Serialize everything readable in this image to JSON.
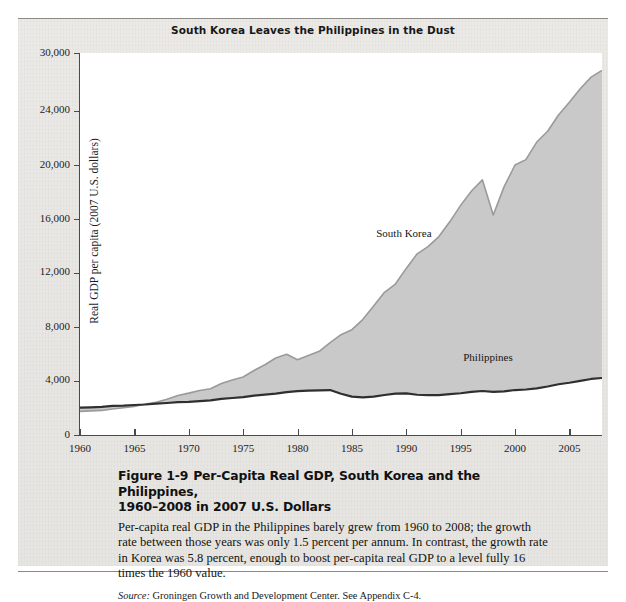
{
  "figure": {
    "chart_title": "South Korea Leaves the Philippines in the Dust",
    "caption_heading_line1": "Per-Capita Real GDP, South Korea and the Philippines,",
    "caption_heading_line2": "1960–2008 in 2007 U.S. Dollars",
    "figure_number": "Figure 1-9",
    "caption_body": "Per-capita real GDP in the Philippines barely grew from 1960 to 2008; the growth rate between those years was only 1.5 percent per annum. In contrast, the growth rate in Korea was 5.8 percent, enough to boost per-capita real GDP to a level fully 16 times the 1960 value.",
    "source_label": "Source:",
    "source_text": "Groningen Growth and Development Center. See Appendix C-4."
  },
  "colors": {
    "korea_fill": "#c9c9c9",
    "korea_line": "#9a9a9a",
    "philippines_line": "#2f2f2f",
    "axis": "#4a4a4a",
    "panel_bg": "#eae8e4",
    "plot_bg": "#ffffff"
  },
  "chart_data": {
    "type": "area",
    "title": "South Korea Leaves the Philippines in the Dust",
    "xlabel": "",
    "ylabel": "Real GDP per capita (2007 U.S. dollars)",
    "xlim": [
      1960,
      2008
    ],
    "ylim": [
      0,
      30000
    ],
    "grid": false,
    "legend_position": "inline-annotation",
    "xticks": [
      1960,
      1965,
      1970,
      1975,
      1980,
      1985,
      1990,
      1995,
      2000,
      2005
    ],
    "xtick_labels": [
      "1960",
      "1965",
      "1970",
      "1975",
      "1980",
      "1985",
      "1990",
      "1995",
      "2000",
      "2005"
    ],
    "yticks": [
      0,
      4000,
      8000,
      12000,
      16000,
      20000,
      24000,
      30000
    ],
    "ytick_labels": [
      "0",
      "4,000",
      "8,000",
      "12,000",
      "16,000",
      "20,000",
      "24,000",
      "30,000"
    ],
    "annotations": [
      {
        "text": "South Korea",
        "x": 1990,
        "y": 14800
      },
      {
        "text": "Philippines",
        "x": 1998,
        "y": 5600
      }
    ],
    "x": [
      1960,
      1961,
      1962,
      1963,
      1964,
      1965,
      1966,
      1967,
      1968,
      1969,
      1970,
      1971,
      1972,
      1973,
      1974,
      1975,
      1976,
      1977,
      1978,
      1979,
      1980,
      1981,
      1982,
      1983,
      1984,
      1985,
      1986,
      1987,
      1988,
      1989,
      1990,
      1991,
      1992,
      1993,
      1994,
      1995,
      1996,
      1997,
      1998,
      1999,
      2000,
      2001,
      2002,
      2003,
      2004,
      2005,
      2006,
      2007,
      2008
    ],
    "series": [
      {
        "name": "South Korea",
        "values": [
          1750,
          1790,
          1820,
          1930,
          2020,
          2110,
          2300,
          2420,
          2640,
          2930,
          3100,
          3300,
          3430,
          3820,
          4080,
          4300,
          4780,
          5200,
          5700,
          5980,
          5570,
          5890,
          6200,
          6850,
          7430,
          7800,
          8550,
          9560,
          10570,
          11180,
          12340,
          13420,
          13950,
          14700,
          15790,
          17010,
          18070,
          18900,
          16300,
          18400,
          20000,
          20400,
          21700,
          22500,
          23700,
          24900,
          26300,
          27500,
          28200
        ]
      },
      {
        "name": "Philippines",
        "values": [
          2020,
          2050,
          2090,
          2160,
          2180,
          2220,
          2260,
          2320,
          2370,
          2430,
          2450,
          2510,
          2560,
          2680,
          2740,
          2800,
          2920,
          2990,
          3070,
          3180,
          3250,
          3280,
          3310,
          3330,
          3050,
          2840,
          2790,
          2840,
          2960,
          3060,
          3080,
          2980,
          2950,
          2960,
          3020,
          3090,
          3190,
          3260,
          3200,
          3230,
          3330,
          3370,
          3450,
          3590,
          3760,
          3870,
          4010,
          4150,
          4220
        ]
      }
    ]
  }
}
